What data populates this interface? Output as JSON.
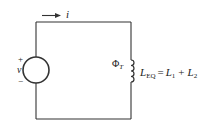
{
  "diagram": {
    "current_label": "i",
    "source_plus": "+",
    "source_label": "v",
    "source_minus": "−",
    "flux_symbol": "Φ",
    "flux_sub": "T",
    "equation": {
      "lhs": "L",
      "lhs_sub": "EQ",
      "equals": "=",
      "t1": "L",
      "t1_sub": "1",
      "plus": "+",
      "t2": "L",
      "t2_sub": "2"
    },
    "colors": {
      "wire": "#333333",
      "background": "#ffffff"
    }
  }
}
